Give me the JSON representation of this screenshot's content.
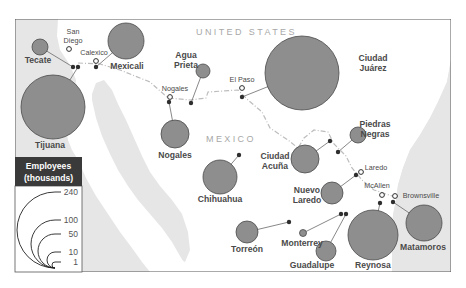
{
  "map": {
    "country_labels": [
      {
        "text": "UNITED   STATES",
        "x": 196,
        "y": 35
      },
      {
        "text": "MEXICO",
        "x": 206,
        "y": 142
      }
    ],
    "colors": {
      "water": "#e6e6e6",
      "land": "#ffffff",
      "bubble_fill": "#8e8e8e",
      "bubble_stroke": "#4a4a4a",
      "border": "#bdbdbd",
      "frame": "#555555"
    },
    "us_cities": [
      {
        "name": "San Diego",
        "lines": [
          "San",
          "Diego"
        ],
        "x": 69,
        "y": 49,
        "lx": 73,
        "ly": 34
      },
      {
        "name": "Calexico",
        "lines": [
          "Calexico"
        ],
        "x": 96,
        "y": 61,
        "lx": 94,
        "ly": 55
      },
      {
        "name": "Nogales",
        "lines": [
          "Nogales"
        ],
        "x": 170,
        "y": 97,
        "lx": 175,
        "ly": 91
      },
      {
        "name": "El Paso",
        "lines": [
          "El Paso"
        ],
        "x": 242,
        "y": 88,
        "lx": 242,
        "ly": 82
      },
      {
        "name": "Laredo",
        "lines": [
          "Laredo"
        ],
        "x": 361,
        "y": 172,
        "lx": 376,
        "ly": 170
      },
      {
        "name": "McAllen",
        "lines": [
          "McAllen"
        ],
        "x": 382,
        "y": 195,
        "lx": 377,
        "ly": 188
      },
      {
        "name": "Brownsville",
        "lines": [
          "Brownsville"
        ],
        "x": 395,
        "y": 196,
        "lx": 421,
        "ly": 198
      }
    ],
    "mx_cities": [
      {
        "name": "Tecate",
        "lines": [
          "Tecate"
        ],
        "employees_thousands": 6,
        "cx": 40,
        "cy": 47,
        "r": 8,
        "dx": 73,
        "dy": 67,
        "lx": 38,
        "ly": 63
      },
      {
        "name": "Tijuana",
        "lines": [
          "Tijuana"
        ],
        "employees_thousands": 170,
        "cx": 53,
        "cy": 107,
        "r": 32,
        "dx": 78,
        "dy": 67,
        "lx": 50,
        "ly": 148
      },
      {
        "name": "Mexicali",
        "lines": [
          "Mexicali"
        ],
        "employees_thousands": 60,
        "cx": 126,
        "cy": 41,
        "r": 18,
        "dx": 96,
        "dy": 67,
        "lx": 127,
        "ly": 69
      },
      {
        "name": "Agua Prieta",
        "lines": [
          "Agua",
          "Prieta"
        ],
        "employees_thousands": 4,
        "cx": 203,
        "cy": 71,
        "r": 7,
        "dx": 191,
        "dy": 103,
        "lx": 186,
        "ly": 58
      },
      {
        "name": "Ciudad Juárez",
        "lines": [
          "Ciudad",
          "Juárez"
        ],
        "employees_thousands": 220,
        "cx": 302,
        "cy": 73,
        "r": 37,
        "dx": 242,
        "dy": 97,
        "lx": 373,
        "ly": 61
      },
      {
        "name": "Nogales",
        "lines": [
          "Nogales"
        ],
        "employees_thousands": 30,
        "cx": 175,
        "cy": 134,
        "r": 14,
        "dx": 169,
        "dy": 102,
        "lx": 175,
        "ly": 158
      },
      {
        "name": "Chihuahua",
        "lines": [
          "Chihuahua"
        ],
        "employees_thousands": 60,
        "cx": 220,
        "cy": 177,
        "r": 17,
        "dx": 239,
        "dy": 155,
        "lx": 220,
        "ly": 202
      },
      {
        "name": "Ciudad Acuña",
        "lines": [
          "Ciudad",
          "Acuña"
        ],
        "employees_thousands": 30,
        "cx": 305,
        "cy": 159,
        "r": 14,
        "dx": 330,
        "dy": 141,
        "lx": 275,
        "ly": 159
      },
      {
        "name": "Piedras Negras",
        "lines": [
          "Piedras",
          "Negras"
        ],
        "employees_thousands": 10,
        "cx": 358,
        "cy": 135,
        "r": 8,
        "dx": 338,
        "dy": 152,
        "lx": 375,
        "ly": 127
      },
      {
        "name": "Nuevo Laredo",
        "lines": [
          "Nuevo",
          "Laredo"
        ],
        "employees_thousands": 20,
        "cx": 332,
        "cy": 193,
        "r": 11,
        "dx": 356,
        "dy": 175,
        "lx": 307,
        "ly": 193
      },
      {
        "name": "Torreón",
        "lines": [
          "Torreón"
        ],
        "employees_thousands": 20,
        "cx": 247,
        "cy": 232,
        "r": 11,
        "dx": 289,
        "dy": 222,
        "lx": 247,
        "ly": 252
      },
      {
        "name": "Monterrey",
        "lines": [
          "Monterrey"
        ],
        "employees_thousands": 1,
        "cx": 303,
        "cy": 233,
        "r": 3.5,
        "dx": 341,
        "dy": 214,
        "lx": 302,
        "ly": 246
      },
      {
        "name": "Guadalupe",
        "lines": [
          "Guadalupe"
        ],
        "employees_thousands": 15,
        "cx": 326,
        "cy": 251,
        "r": 10,
        "dx": 346,
        "dy": 214,
        "lx": 312,
        "ly": 268
      },
      {
        "name": "Reynosa",
        "lines": [
          "Reynosa"
        ],
        "employees_thousands": 95,
        "cx": 373,
        "cy": 235,
        "r": 25,
        "dx": 380,
        "dy": 203,
        "lx": 373,
        "ly": 268
      },
      {
        "name": "Matamoros",
        "lines": [
          "Matamoros"
        ],
        "employees_thousands": 45,
        "cx": 424,
        "cy": 223,
        "r": 18,
        "dx": 393,
        "dy": 202,
        "lx": 423,
        "ly": 250
      }
    ]
  },
  "legend": {
    "title_line1": "Employees",
    "title_line2": "(thousands)",
    "values": [
      {
        "label": "240",
        "r": 38
      },
      {
        "label": "100",
        "r": 24
      },
      {
        "label": "50",
        "r": 17
      },
      {
        "label": "10",
        "r": 8
      },
      {
        "label": "1",
        "r": 3
      }
    ]
  }
}
